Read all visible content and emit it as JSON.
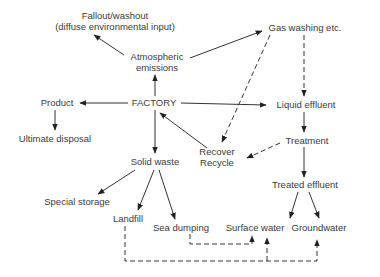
{
  "diagram": {
    "nodes": {
      "fallout_line1": "Fallout/washout",
      "fallout_line2": "(diffuse environmental input)",
      "atmospheric_line1": "Atmospheric",
      "atmospheric_line2": "emissions",
      "gas_washing": "Gas washing etc.",
      "product": "Product",
      "factory": "FACTORY",
      "liquid_effluent": "Liquid effluent",
      "ultimate_disposal": "Ultimate disposal",
      "recover": "Recover",
      "recycle": "Recycle",
      "treatment": "Treatment",
      "solid_waste": "Solid waste",
      "treated_effluent": "Treated effluent",
      "special_storage": "Special storage",
      "landfill": "Landfill",
      "sea_dumping": "Sea dumping",
      "surface_water": "Surface water",
      "groundwater": "Groundwater"
    },
    "edges": [
      {
        "from": "FACTORY",
        "to": "Atmospheric emissions",
        "style": "solid"
      },
      {
        "from": "Atmospheric emissions",
        "to": "Fallout/washout",
        "style": "solid"
      },
      {
        "from": "Atmospheric emissions",
        "to": "Gas washing etc.",
        "style": "solid"
      },
      {
        "from": "FACTORY",
        "to": "Product",
        "style": "solid"
      },
      {
        "from": "Product",
        "to": "Ultimate disposal",
        "style": "solid"
      },
      {
        "from": "FACTORY",
        "to": "Liquid effluent",
        "style": "solid"
      },
      {
        "from": "FACTORY",
        "to": "Solid waste",
        "style": "solid"
      },
      {
        "from": "Recover Recycle",
        "to": "FACTORY",
        "style": "solid"
      },
      {
        "from": "Gas washing etc.",
        "to": "Liquid effluent",
        "style": "dashed"
      },
      {
        "from": "Gas washing etc.",
        "to": "Recover Recycle",
        "style": "dashed"
      },
      {
        "from": "Liquid effluent",
        "to": "Treatment",
        "style": "solid"
      },
      {
        "from": "Treatment",
        "to": "Recover Recycle",
        "style": "dashed"
      },
      {
        "from": "Treatment",
        "to": "Treated effluent",
        "style": "solid"
      },
      {
        "from": "Treated effluent",
        "to": "Surface water",
        "style": "solid"
      },
      {
        "from": "Treated effluent",
        "to": "Groundwater",
        "style": "solid"
      },
      {
        "from": "Solid waste",
        "to": "Special storage",
        "style": "solid"
      },
      {
        "from": "Solid waste",
        "to": "Landfill",
        "style": "solid"
      },
      {
        "from": "Solid waste",
        "to": "Sea dumping",
        "style": "solid"
      },
      {
        "from": "Sea dumping",
        "to": "Surface water",
        "style": "dashed"
      },
      {
        "from": "Landfill",
        "to": "Surface water",
        "style": "dashed"
      },
      {
        "from": "Landfill",
        "to": "Groundwater",
        "style": "dashed"
      }
    ]
  }
}
